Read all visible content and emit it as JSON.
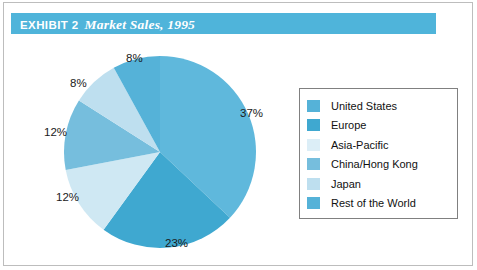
{
  "figure": {
    "exhibit_label": "EXHIBIT 2",
    "exhibit_title": "Market Sales, 1995",
    "title_bar_color": "#4FB4DA",
    "border_color": "#808080"
  },
  "chart_data": {
    "type": "pie",
    "title": "Market Sales, 1995",
    "xlabel": "",
    "ylabel": "",
    "units": "percent",
    "start_angle_deg": 0,
    "direction": "clockwise",
    "legend_position": "right",
    "grid": false,
    "categories": [
      "United States",
      "Europe",
      "Asia-Pacific",
      "China/Hong Kong",
      "Japan",
      "Rest of the World"
    ],
    "values": [
      37,
      23,
      12,
      12,
      8,
      8
    ],
    "value_labels": [
      "37%",
      "23%",
      "12%",
      "12%",
      "8%",
      "8%"
    ],
    "colors": [
      "#5FB8DC",
      "#3FA8D0",
      "#CFE8F3",
      "#76BEDD",
      "#BEDFEF",
      "#55B2D8"
    ]
  },
  "legend": {
    "items": [
      {
        "label": "United States",
        "color": "#55B2D8"
      },
      {
        "label": "Europe",
        "color": "#3FA8D0"
      },
      {
        "label": "Asia-Pacific",
        "color": "#DCEEF7"
      },
      {
        "label": "China/Hong Kong",
        "color": "#76BEDD"
      },
      {
        "label": "Japan",
        "color": "#BEDFEF"
      },
      {
        "label": "Rest of the World",
        "color": "#55B2D8"
      }
    ]
  },
  "pie_labels": [
    {
      "text": "37%",
      "x": 240,
      "y": 73
    },
    {
      "text": "23%",
      "x": 165,
      "y": 203
    },
    {
      "text": "12%",
      "x": 56,
      "y": 157
    },
    {
      "text": "12%",
      "x": 44,
      "y": 92
    },
    {
      "text": "8%",
      "x": 70,
      "y": 43
    },
    {
      "text": "8%",
      "x": 126,
      "y": 18
    }
  ]
}
